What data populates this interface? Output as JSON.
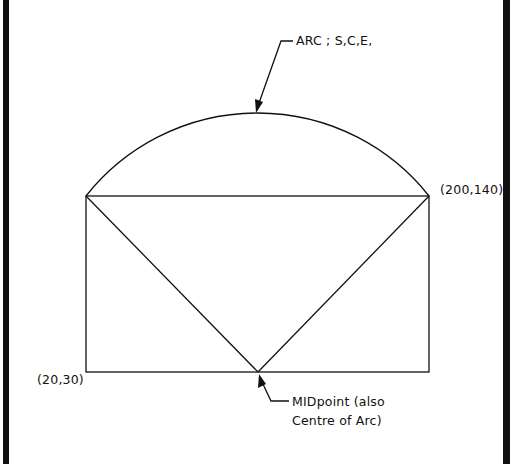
{
  "diagram": {
    "labels": {
      "arc": "ARC ; S,C,E,",
      "top_right_point": "(200,140)",
      "bottom_left_point": "(20,30)",
      "midpoint_line1": "MIDpoint (also",
      "midpoint_line2": "Centre of Arc)"
    },
    "colors": {
      "stroke": "#111111",
      "background": "#ffffff",
      "frame": "#111111"
    },
    "geometry": {
      "rectangle": {
        "x1": 86,
        "y1": 196,
        "x2": 429,
        "y2": 372
      },
      "midpoint": {
        "x": 258,
        "y": 372
      },
      "arc_top": {
        "x": 258,
        "y": 113
      }
    }
  }
}
